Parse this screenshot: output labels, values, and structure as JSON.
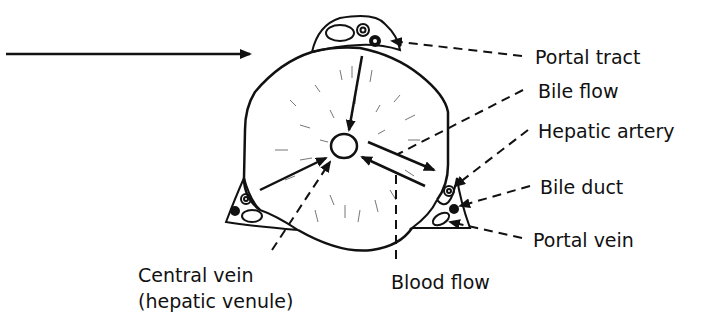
{
  "diagram": {
    "labels": {
      "portal_tract": "Portal tract",
      "bile_flow": "Bile flow",
      "hepatic_artery": "Hepatic artery",
      "bile_duct": "Bile duct",
      "portal_vein": "Portal vein",
      "blood_flow": "Blood flow",
      "central_vein_line1": "Central vein",
      "central_vein_line2": "(hepatic venule)"
    },
    "colors": {
      "ink": "#111111",
      "background": "#ffffff",
      "stipple": "#777777"
    }
  }
}
